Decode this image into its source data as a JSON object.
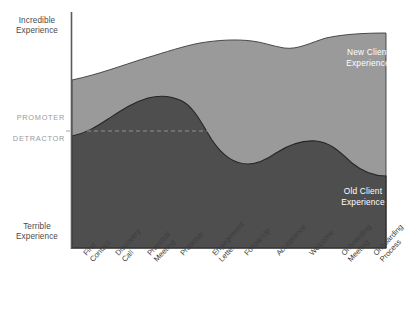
{
  "chart_data": {
    "type": "area",
    "title": "",
    "subtitle": "",
    "xlabel": "",
    "ylabel": "",
    "stacked": true,
    "grid": false,
    "legend_position": "inline-on-bands",
    "axis": {
      "y_top_label": "Incredible Experience",
      "y_bottom_label": "Terrible Experience",
      "ylim": [
        0,
        100
      ],
      "threshold": {
        "value": 55,
        "style": "dashed",
        "above_label": "PROMOTER",
        "below_label": "DETRACTOR"
      }
    },
    "categories": [
      "First Contact",
      "Discovery Call",
      "Proposal Meeting",
      "Proposal",
      "Engagement Letter",
      "Follow-Up",
      "Acceptance",
      "Welcome",
      "Onboarding Meeting",
      "Onboarding Process"
    ],
    "series": [
      {
        "name": "Old Client Experience",
        "color": "#4e4e4e",
        "values": [
          53,
          62,
          72,
          73,
          64,
          50,
          47,
          55,
          60,
          51
        ]
      },
      {
        "name": "New Client Experience",
        "color": "#9a9a9a",
        "values": [
          77,
          80,
          84,
          86,
          88,
          89,
          87,
          88,
          90,
          90
        ]
      }
    ],
    "annotations": [
      {
        "text": "",
        "note": "faint light-gray rotated handwritten mark above curve, illegible"
      }
    ]
  },
  "axis_labels": {
    "y_top": "Incredible Experience",
    "y_top_line1": "Incredible",
    "y_top_line2": "Experience",
    "y_bottom_line1": "Terrible",
    "y_bottom_line2": "Experience",
    "promoter": "PROMOTER",
    "detractor": "DETRACTOR"
  },
  "series_labels": {
    "new_line1": "New Client",
    "new_line2": "Experience",
    "old_line1": "Old Client",
    "old_line2": "Experience"
  },
  "stages": [
    {
      "line1": "First",
      "line2": "Contact"
    },
    {
      "line1": "Discovery",
      "line2": "Call"
    },
    {
      "line1": "Proposal",
      "line2": "Meeting"
    },
    {
      "line1": "Proposal",
      "line2": ""
    },
    {
      "line1": "Engagement",
      "line2": "Letter"
    },
    {
      "line1": "Follow-Up",
      "line2": ""
    },
    {
      "line1": "Acceptance",
      "line2": ""
    },
    {
      "line1": "Welcome",
      "line2": ""
    },
    {
      "line1": "Onboarding",
      "line2": "Meeting"
    },
    {
      "line1": "Onboarding",
      "line2": "Process"
    }
  ],
  "colors": {
    "old_band": "#4e4e4e",
    "new_band": "#9a9a9a",
    "axis": "#5a5a5a",
    "threshold": "#9a9a9a",
    "text": "#3d3d3d"
  },
  "annotation": {
    "faint_text": ""
  }
}
